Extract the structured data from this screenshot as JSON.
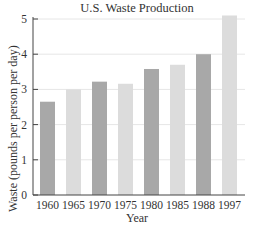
{
  "chart_data": {
    "type": "bar",
    "title": "U.S. Waste Production",
    "xlabel": "Year",
    "ylabel": "Waste (pounds per person per day)",
    "categories": [
      "1960",
      "1965",
      "1970",
      "1975",
      "1980",
      "1985",
      "1988",
      "1997"
    ],
    "values": [
      2.65,
      3.0,
      3.22,
      3.16,
      3.58,
      3.7,
      4.0,
      5.1
    ],
    "ylim": [
      0,
      5
    ],
    "yticks": [
      0,
      1,
      2,
      3,
      4,
      5
    ],
    "grid": true,
    "legend": null,
    "colors": [
      "#a8a8a8",
      "#dcdcdc",
      "#a8a8a8",
      "#dcdcdc",
      "#a8a8a8",
      "#dcdcdc",
      "#a8a8a8",
      "#dcdcdc"
    ],
    "gridline_color": "#e6e6e6",
    "axis_color": "#444444"
  }
}
